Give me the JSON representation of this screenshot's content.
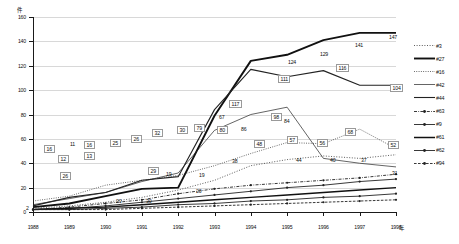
{
  "chart": {
    "type": "line",
    "title": "",
    "y_unit_label": "件",
    "x_unit_label": "年",
    "ylabel": "件",
    "xlabel": "年",
    "ylim": [
      0,
      160
    ],
    "yticks": [
      0,
      20,
      40,
      60,
      80,
      100,
      120,
      140,
      160
    ],
    "grid": true,
    "legend_position": "right",
    "categories": [
      "1988",
      "1989",
      "1990",
      "1991",
      "1992",
      "1993",
      "1994",
      "1995",
      "1996",
      "1997",
      "1998"
    ],
    "series": [
      {
        "name": "#3",
        "style": "dotted-marker",
        "values": [
          3,
          5,
          8,
          12,
          18,
          26,
          38,
          43,
          46,
          44,
          47
        ]
      },
      {
        "name": "#27",
        "style": "solid-thick",
        "values": [
          4,
          7,
          13,
          19,
          20,
          79,
          124,
          129,
          141,
          147,
          147
        ]
      },
      {
        "name": "#16",
        "style": "dotted-fine",
        "values": [
          9,
          13,
          22,
          26,
          30,
          38,
          48,
          57,
          56,
          68,
          52
        ]
      },
      {
        "name": "#42",
        "style": "solid-thin",
        "values": [
          6,
          11,
          16,
          25,
          32,
          67,
          80,
          86,
          44,
          40,
          37
        ]
      },
      {
        "name": "#44",
        "style": "solid-medium",
        "values": [
          5,
          12,
          16,
          26,
          29,
          84,
          117,
          111,
          116,
          104,
          104
        ]
      },
      {
        "name": "#63",
        "style": "dash-dot-marker",
        "values": [
          2,
          4,
          7,
          10,
          15,
          19,
          22,
          24,
          26,
          28,
          31
        ]
      },
      {
        "name": "#9",
        "style": "solid-marker",
        "values": [
          2,
          3,
          5,
          8,
          11,
          14,
          17,
          20,
          22,
          25,
          27
        ]
      },
      {
        "name": "#61",
        "style": "solid-bold",
        "values": [
          2,
          3,
          4,
          6,
          8,
          10,
          12,
          14,
          16,
          18,
          20
        ]
      },
      {
        "name": "#62",
        "style": "solid-marker2",
        "values": [
          2,
          2,
          3,
          4,
          6,
          7,
          9,
          10,
          12,
          13,
          15
        ]
      },
      {
        "name": "#94",
        "style": "dashed-marker",
        "values": [
          2,
          2,
          2,
          3,
          4,
          5,
          6,
          7,
          8,
          9,
          10
        ]
      }
    ],
    "boxed_labels": [
      {
        "text": "16",
        "x": 44,
        "y": 145
      },
      {
        "text": "12",
        "x": 58,
        "y": 155
      },
      {
        "text": "16",
        "x": 84,
        "y": 141
      },
      {
        "text": "13",
        "x": 84,
        "y": 152
      },
      {
        "text": "25",
        "x": 110,
        "y": 139
      },
      {
        "text": "26",
        "x": 131,
        "y": 135
      },
      {
        "text": "32",
        "x": 152,
        "y": 129
      },
      {
        "text": "30",
        "x": 177,
        "y": 126
      },
      {
        "text": "29",
        "x": 148,
        "y": 167
      },
      {
        "text": "26",
        "x": 60,
        "y": 172
      },
      {
        "text": "79",
        "x": 194,
        "y": 124
      },
      {
        "text": "80",
        "x": 217,
        "y": 126
      },
      {
        "text": "48",
        "x": 254,
        "y": 140
      },
      {
        "text": "57",
        "x": 287,
        "y": 136
      },
      {
        "text": "56",
        "x": 317,
        "y": 139
      },
      {
        "text": "68",
        "x": 345,
        "y": 128
      },
      {
        "text": "52",
        "x": 388,
        "y": 141
      },
      {
        "text": "98",
        "x": 271,
        "y": 113
      },
      {
        "text": "117",
        "x": 229,
        "y": 100
      },
      {
        "text": "111",
        "x": 278,
        "y": 75
      },
      {
        "text": "116",
        "x": 336,
        "y": 64
      },
      {
        "text": "104",
        "x": 390,
        "y": 84
      }
    ],
    "plain_labels": [
      {
        "text": "11",
        "x": 70,
        "y": 141
      },
      {
        "text": "19",
        "x": 166,
        "y": 171
      },
      {
        "text": "20",
        "x": 116,
        "y": 198
      },
      {
        "text": "30",
        "x": 146,
        "y": 198
      },
      {
        "text": "20",
        "x": 196,
        "y": 188
      },
      {
        "text": "38",
        "x": 232,
        "y": 158
      },
      {
        "text": "44",
        "x": 296,
        "y": 157
      },
      {
        "text": "40",
        "x": 330,
        "y": 157
      },
      {
        "text": "37",
        "x": 361,
        "y": 157
      },
      {
        "text": "31",
        "x": 392,
        "y": 170
      },
      {
        "text": "19",
        "x": 199,
        "y": 172
      },
      {
        "text": "86",
        "x": 241,
        "y": 126
      },
      {
        "text": "67",
        "x": 219,
        "y": 114
      },
      {
        "text": "84",
        "x": 284,
        "y": 118
      },
      {
        "text": "124",
        "x": 288,
        "y": 59
      },
      {
        "text": "129",
        "x": 320,
        "y": 51
      },
      {
        "text": "141",
        "x": 355,
        "y": 42
      },
      {
        "text": "147",
        "x": 389,
        "y": 34
      },
      {
        "text": "2",
        "x": 26,
        "y": 205
      }
    ]
  }
}
